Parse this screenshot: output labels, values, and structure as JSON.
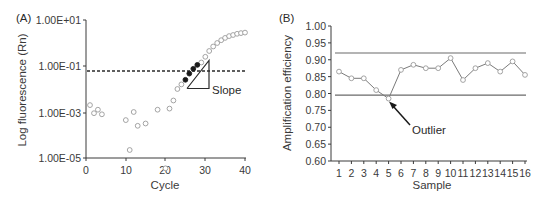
{
  "chart_data": [
    {
      "panel": "(A)",
      "type": "scatter",
      "title": "",
      "xlabel": "Cycle",
      "ylabel": "Log fluorescence (Rn)",
      "xlim": [
        0,
        40
      ],
      "ylim_log10": [
        -5,
        1
      ],
      "yscale": "log",
      "x_ticks": [
        "0",
        "10",
        "20",
        "30",
        "40"
      ],
      "y_ticks": [
        "1.00E-05",
        "1.00E-03",
        "1.00E-01",
        "1.00E+01"
      ],
      "grid": false,
      "threshold_log10": -1.2,
      "annotations": [
        "Slope"
      ],
      "series": [
        {
          "name": "background",
          "marker": "open-circle",
          "x": [
            1,
            2,
            3,
            4,
            10,
            11,
            12,
            13,
            15,
            18,
            20,
            21,
            22
          ],
          "log10_y": [
            -2.7,
            -3.05,
            -2.9,
            -3.1,
            -3.35,
            -4.65,
            -3.0,
            -3.6,
            -3.5,
            -2.9,
            -5.45,
            -2.85,
            -2.5
          ]
        },
        {
          "name": "amplification",
          "marker": "open-circle",
          "x": [
            23,
            24,
            29,
            30,
            31,
            32,
            33,
            34,
            35,
            36,
            37,
            38,
            39,
            40
          ],
          "log10_y": [
            -2.0,
            -1.8,
            -0.85,
            -0.6,
            -0.35,
            -0.15,
            0.0,
            0.12,
            0.22,
            0.3,
            0.35,
            0.4,
            0.43,
            0.45
          ]
        },
        {
          "name": "exponential-phase",
          "marker": "filled-circle",
          "x": [
            25,
            26,
            27,
            28
          ],
          "log10_y": [
            -1.6,
            -1.33,
            -1.12,
            -0.95
          ]
        }
      ],
      "slope_triangle": {
        "x0": 25.5,
        "x1": 31,
        "log10_y0": -1.85,
        "log10_y1": -0.65
      }
    },
    {
      "panel": "(B)",
      "type": "line",
      "title": "",
      "xlabel": "Sample",
      "ylabel": "Amplification efficiency",
      "categories": [
        "1",
        "2",
        "3",
        "4",
        "5",
        "6",
        "7",
        "8",
        "9",
        "10",
        "11",
        "12",
        "13",
        "14",
        "15",
        "16"
      ],
      "ylim": [
        0.6,
        1.0
      ],
      "y_ticks": [
        "0.60",
        "0.65",
        "0.70",
        "0.75",
        "0.80",
        "0.85",
        "0.90",
        "0.95",
        "1.00"
      ],
      "grid": false,
      "series": [
        {
          "name": "Amplification efficiency",
          "marker": "open-circle",
          "values": [
            0.865,
            0.845,
            0.845,
            0.81,
            0.785,
            0.87,
            0.885,
            0.875,
            0.875,
            0.905,
            0.84,
            0.875,
            0.89,
            0.865,
            0.895,
            0.855
          ]
        }
      ],
      "reference_lines": [
        {
          "name": "upper-limit",
          "value": 0.92
        },
        {
          "name": "lower-limit",
          "value": 0.795
        }
      ],
      "annotations": [
        {
          "text": "Outlier",
          "points_to_sample": 5
        }
      ]
    }
  ],
  "panelA": {
    "label": "(A)",
    "xlabel": "Cycle",
    "ylabel": "Log fluorescence (Rn)",
    "yticks": [
      "1.00E+01",
      "1.00E-01",
      "1.00E-03",
      "1.00E-05"
    ],
    "xticks": [
      "0",
      "10",
      "20",
      "30",
      "40"
    ],
    "slope_label": "Slope"
  },
  "panelB": {
    "label": "(B)",
    "xlabel": "Sample",
    "ylabel": "Amplification efficiency",
    "yticks": [
      "1.00",
      "0.95",
      "0.90",
      "0.85",
      "0.80",
      "0.75",
      "0.70",
      "0.65",
      "0.60"
    ],
    "xticks": [
      "1",
      "2",
      "3",
      "4",
      "5",
      "6",
      "7",
      "8",
      "9",
      "10",
      "11",
      "12",
      "13",
      "14",
      "15",
      "16"
    ],
    "outlier_label": "Outlier"
  },
  "colors": {
    "axis": "#3a3a3a",
    "open_marker": "#9a9a9a",
    "filled_marker": "#1a1a1a",
    "line": "#7a7a7a",
    "ref_line": "#6a6a6a",
    "threshold": "#2a2a2a"
  }
}
